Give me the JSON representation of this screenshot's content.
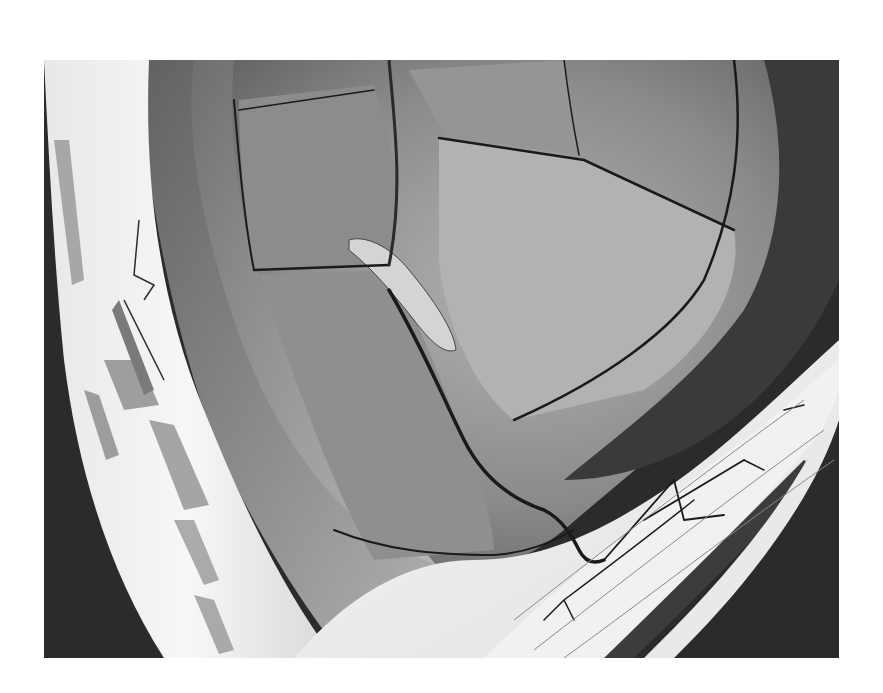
{
  "image": {
    "kind": "grayscale scanning electron micrograph",
    "frame": {
      "x": 44,
      "y": 60,
      "width": 795,
      "height": 598
    },
    "colors": {
      "page_background": "#ffffff",
      "dark_background": "#2b2b2b",
      "plate_gray": "#7d7d7d",
      "plate_light": "#a8a8a8",
      "bright_shell": "#f2f2f2",
      "crack": "#1a1a1a"
    },
    "regions": [
      "left-bright-shell",
      "central-cracked-plates",
      "detached-fragment",
      "lower-right-fibrous-layer",
      "right-dark-band"
    ]
  }
}
